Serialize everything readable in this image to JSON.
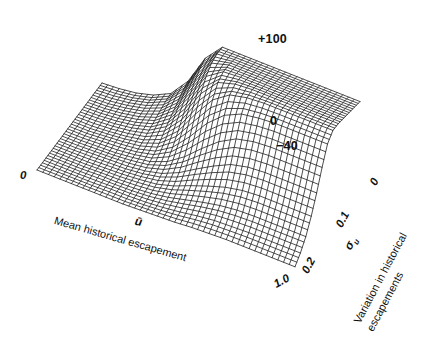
{
  "figure": {
    "type": "3d-wireframe-surface",
    "background_color": "#ffffff",
    "line_color": "#111111"
  },
  "axes": {
    "z": {
      "name": "value",
      "ticks": [
        {
          "label": "+100",
          "value": 100
        },
        {
          "label": "0",
          "value": 0
        },
        {
          "label": "−40",
          "value": -40
        }
      ]
    },
    "x": {
      "title": "Mean historical escapement",
      "symbol": "ū",
      "ticks": [
        {
          "label": "0",
          "value": 0
        },
        {
          "label": "1.0",
          "value": 1.0
        }
      ]
    },
    "y": {
      "title_line1": "Variation in historical",
      "title_line2": "escapements",
      "symbol": "σ",
      "symbol_sub": "u",
      "ticks": [
        {
          "label": "0",
          "value": 0
        },
        {
          "label": "0.1",
          "value": 0.1
        },
        {
          "label": "0.2",
          "value": 0.2
        }
      ]
    }
  },
  "chart_data": {
    "type": "surface",
    "title": "",
    "xlabel": "Mean historical escapement",
    "ylabel": "Variation in historical escapements",
    "zlabel": "",
    "xlim": [
      0,
      1.0
    ],
    "ylim": [
      0,
      0.2
    ],
    "zlim": [
      -40,
      100
    ],
    "grid": true,
    "legend": "none",
    "x": [
      0.0,
      0.0667,
      0.1333,
      0.2,
      0.2667,
      0.3333,
      0.4,
      0.4667,
      0.5333,
      0.6,
      0.6667,
      0.7333,
      0.8,
      0.8667,
      0.9333,
      1.0
    ],
    "y": [
      0.0,
      0.0167,
      0.0333,
      0.05,
      0.0667,
      0.0833,
      0.1,
      0.1167,
      0.1333,
      0.15,
      0.1667,
      0.1833,
      0.2
    ],
    "z": [
      [
        -40,
        -38,
        -34,
        -26,
        -12,
        20,
        70,
        100,
        100,
        100,
        100,
        100,
        100,
        100,
        100,
        100
      ],
      [
        -40,
        -38,
        -34,
        -27,
        -14,
        14,
        62,
        98,
        100,
        100,
        100,
        100,
        100,
        100,
        100,
        100
      ],
      [
        -40,
        -39,
        -35,
        -29,
        -18,
        6,
        50,
        92,
        100,
        100,
        100,
        100,
        100,
        100,
        100,
        100
      ],
      [
        -40,
        -39,
        -36,
        -31,
        -22,
        -2,
        36,
        80,
        98,
        100,
        100,
        100,
        100,
        100,
        100,
        100
      ],
      [
        -40,
        -39,
        -37,
        -33,
        -26,
        -10,
        20,
        62,
        90,
        98,
        100,
        100,
        100,
        100,
        100,
        100
      ],
      [
        -40,
        -40,
        -38,
        -35,
        -30,
        -19,
        4,
        40,
        72,
        90,
        96,
        98,
        98,
        98,
        98,
        98
      ],
      [
        -40,
        -40,
        -38,
        -36,
        -33,
        -26,
        -10,
        16,
        46,
        68,
        80,
        84,
        86,
        86,
        86,
        86
      ],
      [
        -40,
        -40,
        -39,
        -38,
        -35,
        -31,
        -21,
        -4,
        18,
        38,
        52,
        58,
        60,
        60,
        60,
        60
      ],
      [
        -40,
        -40,
        -39,
        -38,
        -37,
        -34,
        -28,
        -17,
        -2,
        12,
        24,
        30,
        32,
        32,
        32,
        32
      ],
      [
        -40,
        -40,
        -40,
        -39,
        -38,
        -36,
        -33,
        -26,
        -16,
        -7,
        1,
        6,
        8,
        8,
        8,
        8
      ],
      [
        -40,
        -40,
        -40,
        -39,
        -39,
        -38,
        -36,
        -32,
        -26,
        -20,
        -15,
        -12,
        -11,
        -11,
        -11,
        -11
      ],
      [
        -40,
        -40,
        -40,
        -40,
        -39,
        -39,
        -38,
        -36,
        -33,
        -29,
        -26,
        -25,
        -24,
        -24,
        -24,
        -24
      ],
      [
        -40,
        -40,
        -40,
        -40,
        -40,
        -40,
        -39,
        -38,
        -37,
        -35,
        -34,
        -33,
        -33,
        -33,
        -33,
        -33
      ]
    ],
    "annotations": [
      {
        "text": "+100",
        "axis": "z"
      },
      {
        "text": "0",
        "axis": "z"
      },
      {
        "text": "−40",
        "axis": "z"
      },
      {
        "text": "0",
        "axis": "x"
      },
      {
        "text": "1.0",
        "axis": "x"
      },
      {
        "text": "0",
        "axis": "y"
      },
      {
        "text": "0.1",
        "axis": "y"
      },
      {
        "text": "0.2",
        "axis": "y"
      }
    ]
  },
  "labels": {
    "z_top": "+100",
    "z_mid": "0",
    "z_bottom": "−40",
    "x_origin": "0",
    "x_max": "1.0",
    "x_title": "Mean historical escapement",
    "x_symbol": "ū",
    "y_origin": "0",
    "y_mid": "0.1",
    "y_max": "0.2",
    "y_title_1": "Variation in historical",
    "y_title_2": "escapements",
    "y_symbol": "σ"
  }
}
